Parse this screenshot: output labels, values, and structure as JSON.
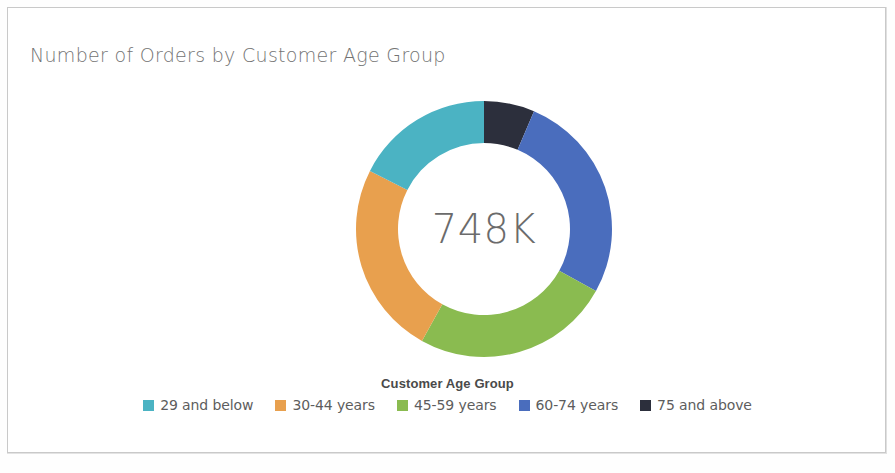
{
  "card": {
    "background": "#ffffff",
    "border_color": "#c9c9c9"
  },
  "header": {
    "title": "Number of Orders by Customer Age Group"
  },
  "donut": {
    "center_label": "748K"
  },
  "legend": {
    "title": "Customer Age Group",
    "items": [
      {
        "label": "29 and below",
        "color": "#4BB3C3"
      },
      {
        "label": "30-44 years",
        "color": "#E8A04E"
      },
      {
        "label": "45-59 years",
        "color": "#8ABB50"
      },
      {
        "label": "60-74 years",
        "color": "#4A6DBD"
      },
      {
        "label": "75 and above",
        "color": "#2C2F3C"
      }
    ]
  },
  "chart_data": {
    "type": "pie",
    "variant": "donut",
    "title": "Number of Orders by Customer Age Group",
    "center_label": "748K",
    "total": 748000,
    "total_display": "748K",
    "legend_title": "Customer Age Group",
    "legend_position": "bottom",
    "categories": [
      "29 and below",
      "30-44 years",
      "45-59 years",
      "60-74 years",
      "75 and above"
    ],
    "values": [
      17.5,
      24.4,
      25.0,
      26.7,
      6.4
    ],
    "value_unit": "percent",
    "colors": [
      "#4BB3C3",
      "#E8A04E",
      "#8ABB50",
      "#4A6DBD",
      "#2C2F3C"
    ],
    "slices": [
      {
        "label": "75 and above",
        "color": "#2C2F3C",
        "percent": 6.4,
        "start_angle": 0,
        "end_angle": 23
      },
      {
        "label": "60-74 years",
        "color": "#4A6DBD",
        "percent": 26.7,
        "start_angle": 23,
        "end_angle": 119
      },
      {
        "label": "45-59 years",
        "color": "#8ABB50",
        "percent": 25.0,
        "start_angle": 119,
        "end_angle": 209
      },
      {
        "label": "30-44 years",
        "color": "#E8A04E",
        "percent": 24.4,
        "start_angle": 209,
        "end_angle": 297
      },
      {
        "label": "29 and below",
        "color": "#4BB3C3",
        "percent": 17.5,
        "start_angle": 297,
        "end_angle": 360
      }
    ],
    "geometry": {
      "cx": 484,
      "cy": 229,
      "outer_radius": 128,
      "inner_radius": 86,
      "start_at": "12 o'clock",
      "direction": "clockwise"
    },
    "grid": false,
    "xlabel": "",
    "ylabel": ""
  }
}
